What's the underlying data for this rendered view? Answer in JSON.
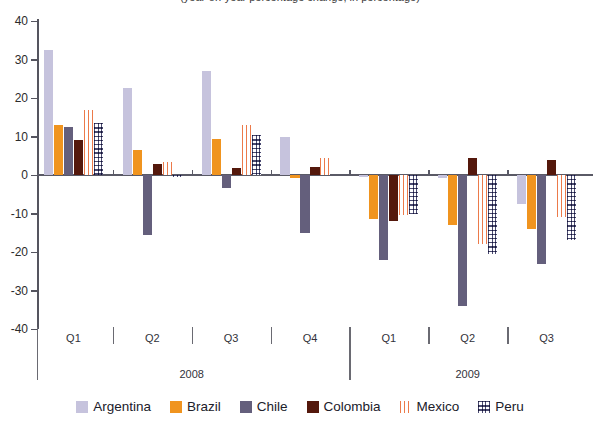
{
  "title": "(year-on-year percentage change, in percentage)",
  "chart_data": {
    "type": "bar",
    "title": "(year-on-year percentage change, in percentage)",
    "xlabel": "",
    "ylabel": "",
    "ylim": [
      -40,
      40
    ],
    "yticks": [
      40,
      30,
      20,
      10,
      0,
      -10,
      -20,
      -30,
      -40
    ],
    "ytick_labels": [
      "40",
      "30",
      "20",
      "10",
      "0",
      "-10",
      "-20",
      "-30",
      "-40"
    ],
    "grid": false,
    "legend_position": "bottom",
    "categories": [
      "Q1",
      "Q2",
      "Q3",
      "Q4",
      "Q1",
      "Q2",
      "Q3"
    ],
    "group_labels": [
      "2008",
      "2009"
    ],
    "groups": [
      {
        "year": "2008",
        "quarters": [
          "Q1",
          "Q2",
          "Q3",
          "Q4"
        ]
      },
      {
        "year": "2009",
        "quarters": [
          "Q1",
          "Q2",
          "Q3"
        ]
      }
    ],
    "series": [
      {
        "name": "Argentina",
        "color": "#c6c3dd",
        "pattern": "solid",
        "values": [
          32.5,
          22.5,
          27.0,
          10.0,
          -0.5,
          -0.8,
          -7.5
        ]
      },
      {
        "name": "Brazil",
        "color": "#f0941f",
        "pattern": "solid",
        "values": [
          13.0,
          6.5,
          9.3,
          -0.8,
          -11.5,
          -13.0,
          -14.0
        ]
      },
      {
        "name": "Chile",
        "color": "#645f7c",
        "pattern": "solid",
        "values": [
          12.5,
          -15.5,
          -3.5,
          -15.0,
          -22.0,
          -34.0,
          -23.0
        ]
      },
      {
        "name": "Colombia",
        "color": "#54180c",
        "pattern": "solid",
        "values": [
          9.0,
          2.8,
          1.8,
          2.2,
          -12.0,
          4.5,
          4.0
        ]
      },
      {
        "name": "Mexico",
        "color": "#ec7a4a",
        "pattern": "vertical-stripes",
        "values": [
          17.0,
          3.3,
          13.0,
          4.5,
          -10.5,
          -18.0,
          -11.0
        ]
      },
      {
        "name": "Peru",
        "color": "#4a4a72",
        "pattern": "grid-crosshatch",
        "values": [
          13.5,
          -0.5,
          10.5,
          0.0,
          -10.0,
          -20.5,
          -17.0
        ]
      }
    ]
  },
  "legend": {
    "items": [
      {
        "label": "Argentina"
      },
      {
        "label": "Brazil"
      },
      {
        "label": "Chile"
      },
      {
        "label": "Colombia"
      },
      {
        "label": "Mexico"
      },
      {
        "label": "Peru"
      }
    ]
  }
}
